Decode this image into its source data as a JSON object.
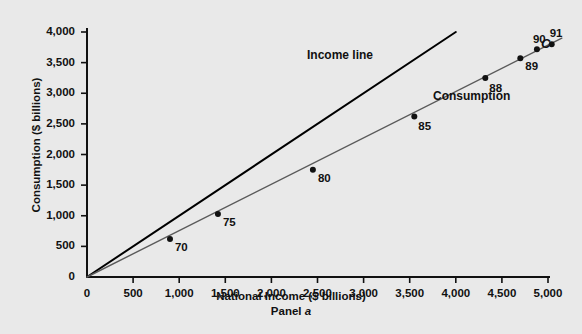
{
  "chart_data": {
    "type": "scatter",
    "title": "",
    "xlabel": "National Income ($ billions)",
    "ylabel": "Consumption ($ billions)",
    "panel_label_prefix": "Panel ",
    "panel_label_letter": "a",
    "xlim": [
      0,
      5200
    ],
    "ylim": [
      0,
      4150
    ],
    "xticks": [
      0,
      500,
      1000,
      1500,
      2000,
      2500,
      3000,
      3500,
      4000,
      4500,
      5000
    ],
    "xtick_labels": [
      "0",
      "500",
      "1,000",
      "1,500",
      "2,000",
      "2,500",
      "3,000",
      "3,500",
      "4,000",
      "4,500",
      "5,000"
    ],
    "yticks": [
      500,
      1000,
      1500,
      2000,
      2500,
      3000,
      3500,
      4000
    ],
    "ytick_labels": [
      "500",
      "1,000",
      "1,500",
      "2,000",
      "2,500",
      "3,000",
      "3,500",
      "4,000"
    ],
    "y_origin_label": "0",
    "grid": false,
    "legend_position": "inline-annotations",
    "series": [
      {
        "name": "Income line",
        "type": "line",
        "color": "#000000",
        "width": 2,
        "points": [
          [
            0,
            0
          ],
          [
            4000,
            4000
          ]
        ],
        "annotation": "Income line"
      },
      {
        "name": "Consumption",
        "type": "line",
        "color": "#5a5a5a",
        "width": 1.4,
        "points": [
          [
            0,
            0
          ],
          [
            5150,
            3900
          ]
        ],
        "annotation": "Consumption",
        "endpoint_label": "C"
      }
    ],
    "data_points": [
      {
        "label": "70",
        "x": 900,
        "y": 620
      },
      {
        "label": "75",
        "x": 1420,
        "y": 1030
      },
      {
        "label": "80",
        "x": 2450,
        "y": 1750
      },
      {
        "label": "85",
        "x": 3550,
        "y": 2620
      },
      {
        "label": "88",
        "x": 4320,
        "y": 3250
      },
      {
        "label": "89",
        "x": 4700,
        "y": 3570
      },
      {
        "label": "90",
        "x": 4880,
        "y": 3720
      },
      {
        "label": "91",
        "x": 5040,
        "y": 3800
      }
    ],
    "point_marker": {
      "shape": "circle",
      "radius": 3,
      "color": "#111111"
    }
  },
  "annotations": {
    "income_line": "Income line",
    "consumption": "Consumption",
    "c_marker": "C"
  },
  "colors": {
    "background": "#e9e9e9",
    "axis": "#111111",
    "income_line": "#000000",
    "consumption_line": "#5a5a5a",
    "text": "#111111"
  }
}
